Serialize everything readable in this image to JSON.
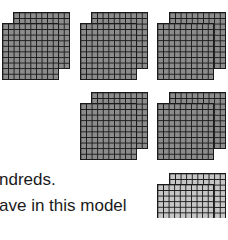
{
  "blocks": [
    {
      "group": "hundreds-1",
      "shade": "dark"
    },
    {
      "group": "hundreds-2",
      "shade": "dark"
    },
    {
      "group": "hundreds-3",
      "shade": "dark"
    },
    {
      "group": "hundreds-4",
      "shade": "dark"
    },
    {
      "group": "hundreds-5",
      "shade": "dark"
    },
    {
      "group": "hundreds-6",
      "shade": "light"
    }
  ],
  "colors": {
    "dark_fill": "#8c8c8c",
    "light_fill": "#c6c6c6",
    "line": "#1a1a1a"
  },
  "text": {
    "line1": "ndreds.",
    "line2": "ave in this model"
  }
}
